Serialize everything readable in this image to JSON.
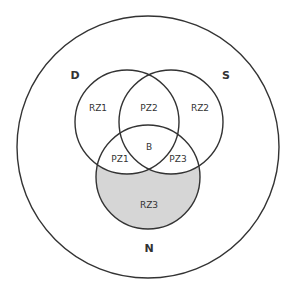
{
  "diagram": {
    "type": "venn",
    "colors": {
      "stroke": "#333333",
      "shaded_fill": "#d6d6d6",
      "background": "#ffffff"
    },
    "outer_region": {
      "labels": {
        "top_left": "D",
        "top_right": "S",
        "bottom": "N"
      }
    },
    "regions": {
      "rz1": "RZ1",
      "pz2": "PZ2",
      "rz2": "RZ2",
      "b": "B",
      "pz1": "PZ1",
      "pz3": "PZ3",
      "rz3": "RZ3"
    },
    "shaded_region": "RZ3"
  }
}
